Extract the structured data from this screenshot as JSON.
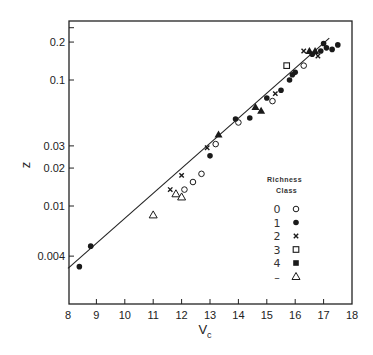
{
  "chart_data": {
    "type": "scatter",
    "title": "",
    "xlabel": "V",
    "xlabel_subscript": "c",
    "ylabel": "z",
    "xlim": [
      8,
      18
    ],
    "ylim": [
      0.003,
      0.27
    ],
    "yscale": "log",
    "grid": false,
    "x_ticks": [
      8,
      9,
      10,
      11,
      12,
      13,
      14,
      15,
      16,
      17,
      18
    ],
    "y_ticks": [
      0.004,
      0.01,
      0.02,
      0.03,
      0.1,
      0.2
    ],
    "y_tick_labels": [
      "0.004",
      "0.01",
      "0.02",
      "0.03",
      "0.1",
      "0.2"
    ],
    "legend": {
      "title_line1": "Richness",
      "title_line2": "Class",
      "position": "lower right",
      "entries": [
        {
          "label": "0",
          "marker": "open-circle"
        },
        {
          "label": "1",
          "marker": "filled-circle"
        },
        {
          "label": "2",
          "marker": "cross"
        },
        {
          "label": "3",
          "marker": "open-square"
        },
        {
          "label": "4",
          "marker": "filled-square"
        },
        {
          "label": "–",
          "marker": "open-triangle"
        }
      ]
    },
    "fit_line": {
      "x": [
        8.0,
        17.2
      ],
      "y": [
        0.0032,
        0.215
      ]
    },
    "series": [
      {
        "name": "0",
        "marker": "open-circle",
        "points": [
          [
            12.1,
            0.0135
          ],
          [
            12.4,
            0.0155
          ],
          [
            12.7,
            0.018
          ],
          [
            13.2,
            0.031
          ],
          [
            14.0,
            0.046
          ],
          [
            15.2,
            0.068
          ],
          [
            16.3,
            0.13
          ]
        ]
      },
      {
        "name": "1",
        "marker": "filled-circle",
        "points": [
          [
            8.4,
            0.0033
          ],
          [
            8.8,
            0.0048
          ],
          [
            13.0,
            0.025
          ],
          [
            13.9,
            0.049
          ],
          [
            14.4,
            0.05
          ],
          [
            15.0,
            0.072
          ],
          [
            15.5,
            0.083
          ],
          [
            15.8,
            0.1
          ],
          [
            15.9,
            0.11
          ],
          [
            16.0,
            0.115
          ],
          [
            16.6,
            0.16
          ],
          [
            16.9,
            0.17
          ],
          [
            17.0,
            0.195
          ],
          [
            17.1,
            0.18
          ],
          [
            17.3,
            0.175
          ],
          [
            17.5,
            0.19
          ]
        ]
      },
      {
        "name": "2",
        "marker": "cross",
        "points": [
          [
            11.6,
            0.0135
          ],
          [
            12.0,
            0.0175
          ],
          [
            12.9,
            0.029
          ],
          [
            15.3,
            0.078
          ],
          [
            16.3,
            0.17
          ],
          [
            16.8,
            0.155
          ]
        ]
      },
      {
        "name": "3",
        "marker": "open-square",
        "points": [
          [
            15.7,
            0.13
          ]
        ]
      },
      {
        "name": "4",
        "marker": "filled-triangle",
        "points": [
          [
            13.3,
            0.037
          ],
          [
            14.6,
            0.061
          ],
          [
            14.8,
            0.057
          ],
          [
            16.5,
            0.17
          ],
          [
            16.7,
            0.17
          ]
        ]
      },
      {
        "name": "–",
        "marker": "open-triangle",
        "points": [
          [
            11.0,
            0.0085
          ],
          [
            11.8,
            0.0125
          ],
          [
            12.0,
            0.0118
          ]
        ]
      }
    ]
  },
  "plot_frame": {
    "left": 69,
    "right": 352,
    "top": 21,
    "bottom": 304
  },
  "axis_map": {
    "x0": 8,
    "x1": 18,
    "px0": 68,
    "px1": 352,
    "y_ref_val": 0.1,
    "y_ref_px": 80,
    "px_per_decade": 126
  }
}
